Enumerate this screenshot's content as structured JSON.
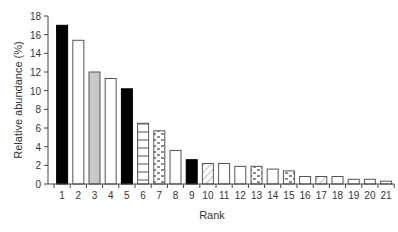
{
  "chart_data": {
    "type": "bar",
    "title": "",
    "xlabel": "Rank",
    "ylabel": "Relative abundance (%)",
    "ylim": [
      0,
      18
    ],
    "yticks": [
      0,
      2,
      4,
      6,
      8,
      10,
      12,
      14,
      16,
      18
    ],
    "grid": false,
    "legend": null,
    "categories": [
      "1",
      "2",
      "3",
      "4",
      "5",
      "6",
      "7",
      "8",
      "9",
      "10",
      "11",
      "12",
      "13",
      "14",
      "15",
      "16",
      "17",
      "18",
      "19",
      "20",
      "21"
    ],
    "values": [
      17.0,
      15.4,
      12.0,
      11.3,
      10.2,
      6.5,
      5.7,
      3.6,
      2.6,
      2.2,
      2.2,
      1.9,
      1.9,
      1.6,
      1.4,
      0.8,
      0.8,
      0.8,
      0.5,
      0.5,
      0.3
    ],
    "bar_fills": [
      "black",
      "white",
      "gray",
      "white",
      "black",
      "horizontal-lines",
      "dashes",
      "white",
      "black",
      "diagonal-hatch",
      "white",
      "white",
      "dashes",
      "white",
      "dashes",
      "white",
      "diagonal-hatch",
      "white",
      "white",
      "white",
      "white"
    ]
  },
  "colors": {
    "black": "#000000",
    "white": "#ffffff",
    "gray": "#c8c8c8",
    "outline": "#555555",
    "axis": "#444444"
  }
}
